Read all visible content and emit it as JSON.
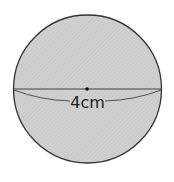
{
  "figure": {
    "shape": "circle",
    "diameter_label": "4cm",
    "fill_color": "#cfcfcf",
    "stroke_color": "#333333",
    "hatch_color": "#bdbdbd"
  }
}
